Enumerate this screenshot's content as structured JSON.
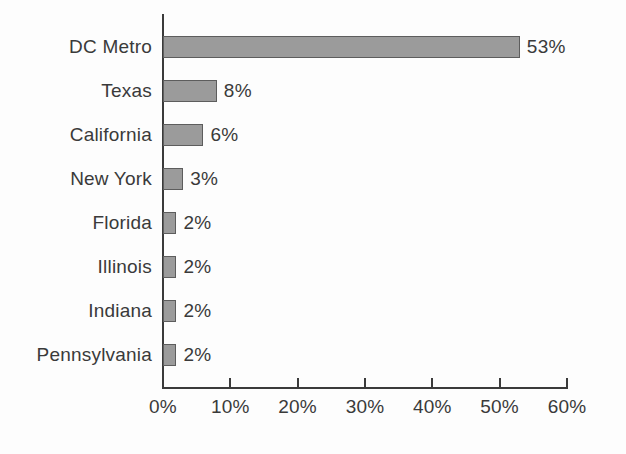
{
  "chart_data": {
    "type": "bar",
    "orientation": "horizontal",
    "title": "",
    "subtitle": "",
    "xlabel": "",
    "ylabel": "",
    "categories": [
      "DC Metro",
      "Texas",
      "California",
      "New York",
      "Florida",
      "Illinois",
      "Indiana",
      "Pennsylvania"
    ],
    "values": [
      53,
      8,
      6,
      3,
      2,
      2,
      2,
      2
    ],
    "value_labels": [
      "53%",
      "8%",
      "6%",
      "3%",
      "2%",
      "2%",
      "2%",
      "2%"
    ],
    "xlim": [
      0,
      60
    ],
    "x_tick_values": [
      0,
      10,
      20,
      30,
      40,
      50,
      60
    ],
    "x_tick_labels": [
      "0%",
      "10%",
      "20%",
      "30%",
      "40%",
      "50%",
      "60%"
    ],
    "grid": false,
    "legend": null,
    "series": [
      {
        "name": "",
        "values": [
          53,
          8,
          6,
          3,
          2,
          2,
          2,
          2
        ]
      }
    ],
    "colors": {
      "bar_fill": "#9b9b9b",
      "bar_stroke": "#5d5d5d",
      "axis": "#3b3b3b",
      "text": "#3a3a3a",
      "background": "#fdfdfd"
    }
  }
}
